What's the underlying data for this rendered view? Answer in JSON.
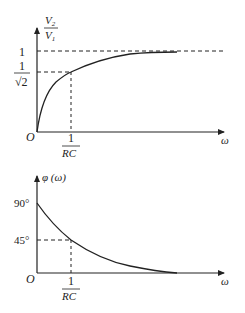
{
  "figure": {
    "top_plot": {
      "y_axis_label_num": "V",
      "y_axis_label_num_sub": "2",
      "y_axis_label_den": "V",
      "y_axis_label_den_sub": "1",
      "x_axis_label": "ω",
      "origin_label": "O",
      "y_tick_1": "1",
      "y_tick_inv_sqrt2_num": "1",
      "y_tick_inv_sqrt2_den": "√2",
      "x_tick_num": "1",
      "x_tick_den": "RC"
    },
    "bottom_plot": {
      "y_axis_label": "φ (ω)",
      "x_axis_label": "ω",
      "origin_label": "O",
      "y_tick_90": "90°",
      "y_tick_45": "45°",
      "x_tick_num": "1",
      "x_tick_den": "RC"
    },
    "colors": {
      "line": "#222222",
      "background": "#ffffff"
    }
  }
}
